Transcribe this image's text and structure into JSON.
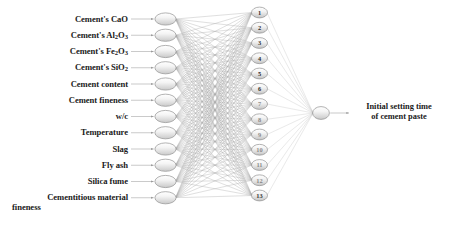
{
  "diagram": {
    "type": "feedforward-neural-network",
    "colors": {
      "background": "#ffffff",
      "node_fill_light": "#fbfbfb",
      "node_fill_dark": "#d2d2d2",
      "node_stroke": "#8a8a8a",
      "connection": "#8e8e8e",
      "arrow": "#9a9a9a",
      "text": "#1a1a1a"
    },
    "layers": {
      "input": {
        "name": "input-layer",
        "count": 12,
        "nodes": [
          {
            "label_html": "Cement's CaO",
            "label_text": "Cement's CaO"
          },
          {
            "label_html": "Cement's Al<sub>2</sub>O<sub>3</sub>",
            "label_text": "Cement's Al2O3"
          },
          {
            "label_html": "Cement's Fe<sub>2</sub>O<sub>3</sub>",
            "label_text": "Cement's Fe2O3"
          },
          {
            "label_html": "Cement's SiO<sub>2</sub>",
            "label_text": "Cement's SiO2"
          },
          {
            "label_html": "Cement content",
            "label_text": "Cement content"
          },
          {
            "label_html": "Cement fineness",
            "label_text": "Cement fineness"
          },
          {
            "label_html": "w/c",
            "label_text": "w/c"
          },
          {
            "label_html": "Temperature",
            "label_text": "Temperature"
          },
          {
            "label_html": "Slag",
            "label_text": "Slag"
          },
          {
            "label_html": "Fly ash",
            "label_text": "Fly ash"
          },
          {
            "label_html": "Silica fume",
            "label_text": "Silica fume"
          },
          {
            "label_html": "Cementitious material fineness",
            "label_text": "Cementitious material fineness"
          }
        ]
      },
      "hidden": {
        "name": "hidden-layer",
        "count": 13,
        "node_numbers": [
          "1",
          "2",
          "3",
          "4",
          "5",
          "6",
          "7",
          "8",
          "9",
          "10",
          "11",
          "12",
          "13"
        ]
      },
      "output": {
        "name": "output-layer",
        "count": 1,
        "label_lines": [
          "Initial setting time",
          "of cement paste"
        ]
      }
    }
  }
}
